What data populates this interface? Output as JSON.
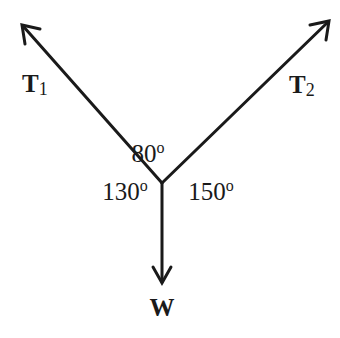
{
  "diagram": {
    "type": "force-vector-diagram",
    "colors": {
      "stroke": "#1a1a1a",
      "background": "#ffffff"
    },
    "vectors": [
      {
        "id": "T1",
        "label_main": "T",
        "label_sub": "1",
        "direction": "up-left"
      },
      {
        "id": "T2",
        "label_main": "T",
        "label_sub": "2",
        "direction": "up-right"
      },
      {
        "id": "W",
        "label_main": "W",
        "label_sub": "",
        "direction": "down"
      }
    ],
    "angles": [
      {
        "between": [
          "T1",
          "T2"
        ],
        "value": "80",
        "unit": "o"
      },
      {
        "between": [
          "T1",
          "W"
        ],
        "value": "130",
        "unit": "o"
      },
      {
        "between": [
          "T2",
          "W"
        ],
        "value": "150",
        "unit": "o"
      }
    ]
  }
}
